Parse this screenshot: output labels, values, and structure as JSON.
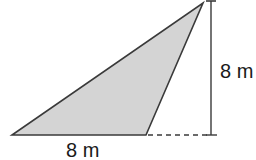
{
  "figure": {
    "shape": "obtuse triangle",
    "fill_color": "#d4d4d4",
    "stroke_color": "#3a3a3a",
    "base_label": "8 m",
    "height_label": "8 m",
    "vertices": {
      "base_left": [
        12,
        135
      ],
      "base_right": [
        146,
        135
      ],
      "apex": [
        203,
        3
      ]
    },
    "height_line": {
      "x": 211,
      "y_top": 1,
      "y_bottom": 135
    },
    "dashed_extension": {
      "x_start": 147,
      "x_end": 217,
      "y": 135
    }
  }
}
